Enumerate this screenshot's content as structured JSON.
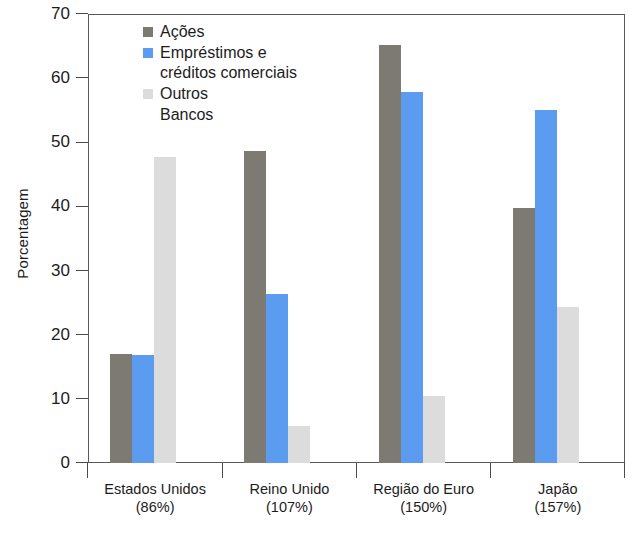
{
  "chart_data": {
    "type": "bar",
    "title": "",
    "xlabel": "",
    "ylabel": "Porcentagem",
    "ylim": [
      0,
      70
    ],
    "yticks": [
      0,
      10,
      20,
      30,
      40,
      50,
      60,
      70
    ],
    "ytick_labels": [
      "0",
      "10",
      "20",
      "30",
      "40",
      "50",
      "60",
      "70"
    ],
    "grid": false,
    "legend_position": "top-left-inside",
    "categories": [
      "Estados Unidos\n(86%)",
      "Reino Unido\n(107%)",
      "Região do Euro\n(150%)",
      "Japão\n(157%)"
    ],
    "category_lines": [
      {
        "line1": "Estados Unidos",
        "line2": "(86%)"
      },
      {
        "line1": "Reino Unido",
        "line2": "(107%)"
      },
      {
        "line1": "Região do Euro",
        "line2": "(150%)"
      },
      {
        "line1": "Japão",
        "line2": "(157%)"
      }
    ],
    "series": [
      {
        "name": "Ações",
        "color": "#7d7a74",
        "values": [
          17.0,
          48.7,
          65.1,
          39.8
        ]
      },
      {
        "name": "Empréstimos e créditos comerciais",
        "color": "#5b9bf0",
        "values": [
          16.8,
          26.3,
          57.8,
          55.0
        ]
      },
      {
        "name": "Outros\nBancos",
        "color": "#dcdcdc",
        "values": [
          47.7,
          5.8,
          10.4,
          24.3
        ]
      }
    ]
  },
  "legend": {
    "entries": [
      {
        "label": "Ações",
        "color": "#7d7a74",
        "swatch": true
      },
      {
        "label": "Empréstimos e\ncréditos comerciais",
        "color": "#5b9bf0",
        "swatch": true
      },
      {
        "label": "Outros",
        "color": "#dcdcdc",
        "swatch": true
      },
      {
        "label": "Bancos",
        "color": "#dcdcdc",
        "swatch": false
      }
    ]
  },
  "axes": {
    "y_title": "Porcentagem"
  },
  "colors": {
    "acoes": "#7d7a74",
    "emprestimos": "#5b9bf0",
    "outros": "#dcdcdc",
    "axis": "#4a4a4a",
    "text": "#1c1c1c"
  }
}
